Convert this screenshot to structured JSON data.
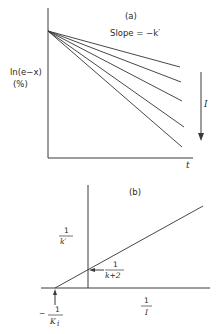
{
  "figure": {
    "panel_a": {
      "label": "(a)",
      "annotation": "Slope = −k′",
      "y_label_line1": "ln(e−x)",
      "y_label_line2": "(%)",
      "x_label": "t",
      "arrow_label": "I",
      "origin_point": [
        48,
        31
      ],
      "axes": {
        "x0": 48,
        "y_top": 8,
        "y_axis_bottom": 158,
        "x_right": 193
      },
      "lines": [
        {
          "x1": 48,
          "y1": 31,
          "x2": 180,
          "y2": 67
        },
        {
          "x1": 48,
          "y1": 31,
          "x2": 181,
          "y2": 82
        },
        {
          "x1": 48,
          "y1": 31,
          "x2": 182,
          "y2": 101
        },
        {
          "x1": 48,
          "y1": 31,
          "x2": 184,
          "y2": 127
        },
        {
          "x1": 48,
          "y1": 31,
          "x2": 182,
          "y2": 147
        }
      ],
      "arrow": {
        "x": 201,
        "y1": 72,
        "y2": 140
      }
    },
    "panel_b": {
      "label": "(b)",
      "y_label_num": "1",
      "y_label_den": "k′",
      "x_label_num": "1",
      "x_label_den": "I",
      "intercept_y_num": "1",
      "intercept_y_den": "k+2",
      "intercept_x_prefix": "−",
      "intercept_x_num": "1",
      "intercept_x_den": "K",
      "intercept_x_den_sub": "i",
      "axes": {
        "v_x": 88,
        "v_top": 185,
        "h_y": 288,
        "h_left": 41,
        "h_right": 210
      },
      "line": {
        "x1": 55,
        "y1": 288,
        "x2": 203,
        "y2": 206
      }
    }
  }
}
